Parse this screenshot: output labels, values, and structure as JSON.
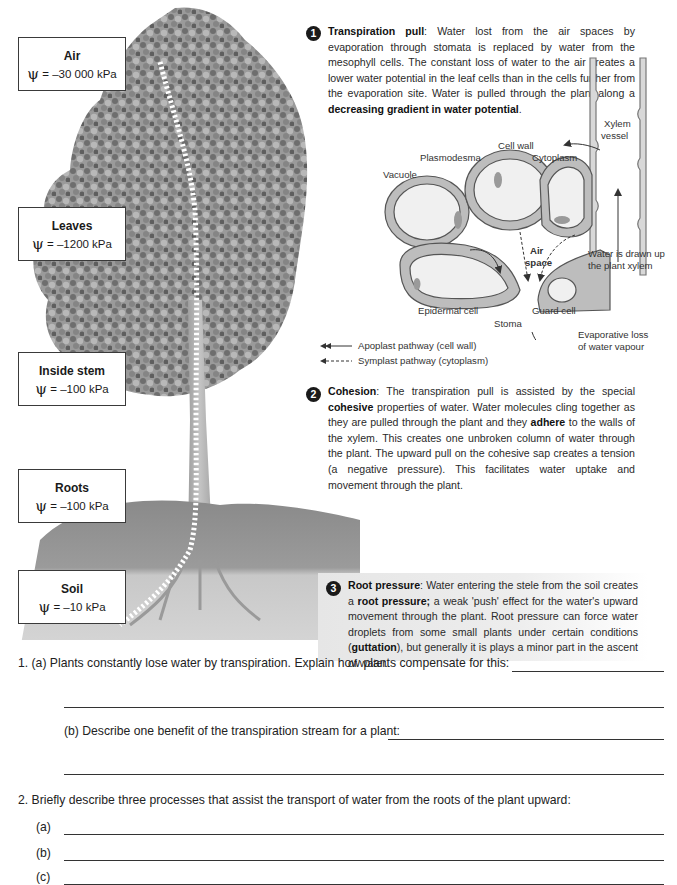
{
  "potential_labels": [
    {
      "title": "Air",
      "symbol": "ψ",
      "value": "= –30 000 kPa"
    },
    {
      "title": "Leaves",
      "symbol": "ψ",
      "value": "= –1200 kPa"
    },
    {
      "title": "Inside stem",
      "symbol": "ψ",
      "value": "= –100 kPa"
    },
    {
      "title": "Roots",
      "symbol": "ψ",
      "value": "= –100 kPa"
    },
    {
      "title": "Soil",
      "symbol": "ψ",
      "value": "= –10 kPa"
    }
  ],
  "sections": [
    {
      "number": "1",
      "heading": "Transpiration pull",
      "text_1": ":  Water lost from the air spaces by evaporation through stomata is replaced by water from the mesophyll cells. The constant loss of water to the air creates a lower water potential in the leaf cells than in the cells further from the evaporation site. Water is pulled through the plant along a ",
      "bold_1": "decreasing gradient in water potential",
      "text_2": "."
    },
    {
      "number": "2",
      "heading": "Cohesion",
      "text_1": ": The transpiration pull is assisted by the special ",
      "bold_1": "cohesive",
      "text_2": " properties of water. Water molecules cling together as they are pulled through the plant and they ",
      "bold_2": "adhere",
      "text_3": " to the walls of the xylem. This creates one unbroken column of water through the plant. The upward pull on the cohesive sap creates a tension (a negative pressure). This facilitates water uptake and movement through the plant."
    },
    {
      "number": "3",
      "heading": "Root pressure",
      "text_1": ": Water entering the stele from the soil creates a ",
      "bold_1": "root pressure;",
      "text_2": " a weak 'push' effect for the water's upward movement through the plant. Root pressure can force water droplets from some small plants under certain conditions (",
      "bold_2": "guttation",
      "text_3": "), but generally it is plays a minor part in the ascent of water."
    }
  ],
  "diagram": {
    "labels": {
      "cell_wall": "Cell wall",
      "cytoplasm": "Cytoplasm",
      "plasmodesma": "Plasmodesma",
      "vacuole": "Vacuole",
      "xylem_vessel_1": "Xylem",
      "xylem_vessel_2": "vessel",
      "air_space_1": "Air",
      "air_space_2": "space",
      "water_drawn_1": "Water is drawn up",
      "water_drawn_2": "the plant xylem",
      "epidermal_cell": "Epidermal cell",
      "guard_cell": "Guard cell",
      "stoma": "Stoma",
      "evaporative_1": "Evaporative loss",
      "evaporative_2": "of water vapour"
    },
    "legend": [
      {
        "style": "solid",
        "label": "Apoplast pathway (cell wall)"
      },
      {
        "style": "dashed",
        "label": "Symplast pathway (cytoplasm)"
      }
    ]
  },
  "questions": {
    "q1a": "1.  (a) Plants constantly lose water by transpiration. Explain how plants compensate for this:",
    "q1b": "(b) Describe one benefit of the transpiration stream for a plant:",
    "q2": "2.  Briefly describe three processes that assist the transport of water from the roots of the plant upward:",
    "q2_parts": [
      "(a)",
      "(b)",
      "(c)"
    ]
  }
}
